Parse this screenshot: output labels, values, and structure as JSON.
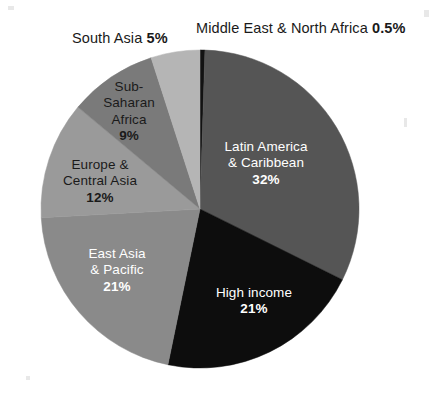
{
  "chart_data": {
    "type": "pie",
    "title": "",
    "subtitle": "",
    "xlabel": "",
    "ylabel": "",
    "legend_position": "none",
    "grid": false,
    "start_angle_deg": 0,
    "direction": "clockwise",
    "categories": [
      "Middle East & North Africa",
      "Latin America & Caribbean",
      "High income",
      "East Asia & Pacific",
      "Europe & Central Asia",
      "Sub-Saharan Africa",
      "South Asia"
    ],
    "values": [
      0.5,
      32,
      21,
      21,
      12,
      9,
      5
    ],
    "value_labels": [
      "0.5%",
      "32%",
      "21%",
      "21%",
      "12%",
      "9%",
      "5%"
    ],
    "colors": [
      "#121212",
      "#555555",
      "#0d0d0d",
      "#8a8a8a",
      "#9a9a9a",
      "#7a7a7a",
      "#b5b5b5"
    ],
    "slices": [
      {
        "name": "Middle East & North Africa",
        "value": 0.5,
        "value_label": "0.5%",
        "color": "#121212",
        "label_placement": "outside",
        "label_text_color": "#1a1a1a"
      },
      {
        "name": "Latin America & Caribbean",
        "value": 32,
        "value_label": "32%",
        "color": "#555555",
        "label_placement": "inside",
        "label_text_color": "#ffffff"
      },
      {
        "name": "High income",
        "value": 21,
        "value_label": "21%",
        "color": "#0d0d0d",
        "label_placement": "inside",
        "label_text_color": "#ffffff"
      },
      {
        "name": "East Asia & Pacific",
        "value": 21,
        "value_label": "21%",
        "color": "#8a8a8a",
        "label_placement": "inside",
        "label_text_color": "#ffffff"
      },
      {
        "name": "Europe & Central Asia",
        "value": 12,
        "value_label": "12%",
        "color": "#9a9a9a",
        "label_placement": "inside",
        "label_text_color": "#1a1a1a"
      },
      {
        "name": "Sub-Saharan Africa",
        "value": 9,
        "value_label": "9%",
        "color": "#7a7a7a",
        "label_placement": "inside",
        "label_text_color": "#1a1a1a"
      },
      {
        "name": "South Asia",
        "value": 5,
        "value_label": "5%",
        "color": "#b5b5b5",
        "label_placement": "outside",
        "label_text_color": "#1a1a1a"
      }
    ]
  },
  "callouts": {
    "south_asia": {
      "name": "South Asia ",
      "pct": "5%"
    },
    "middle_east": {
      "name": "Middle East & North Africa ",
      "pct": "0.5%"
    }
  },
  "slice_labels": {
    "sub_saharan_africa": {
      "line1": "Sub-",
      "line2": "Saharan",
      "line3": "Africa",
      "pct": "9%"
    },
    "europe_central_asia": {
      "line1": "Europe &",
      "line2": "Central Asia",
      "pct": "12%"
    },
    "east_asia_pacific": {
      "line1": "East Asia",
      "line2": "& Pacific",
      "pct": "21%"
    },
    "latin_america_caribbean": {
      "line1": "Latin America",
      "line2": "& Caribbean",
      "pct": "32%"
    },
    "high_income": {
      "line1": "High income",
      "pct": "21%"
    }
  }
}
